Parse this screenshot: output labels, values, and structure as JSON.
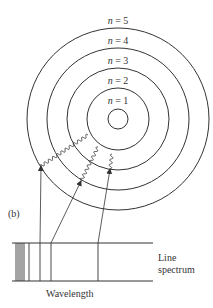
{
  "diagram": {
    "title_panel_label": "(b)",
    "orbit_labels": [
      {
        "label": "n = 5",
        "var": "n",
        "value": "5",
        "x": 118,
        "y": 15
      },
      {
        "label": "n = 4",
        "var": "n",
        "value": "4",
        "x": 118,
        "y": 35
      },
      {
        "label": "n = 3",
        "var": "n",
        "value": "3",
        "x": 118,
        "y": 55
      },
      {
        "label": "n = 2",
        "var": "n",
        "value": "2",
        "x": 118,
        "y": 75
      },
      {
        "label": "n = 1",
        "var": "n",
        "value": "1",
        "x": 118,
        "y": 95
      }
    ],
    "nucleus": {
      "cx": 118,
      "cy": 119,
      "r": 10
    },
    "orbits_radii": [
      31,
      51,
      71,
      91
    ],
    "transitions": [
      {
        "name": "transition-a",
        "wavy_from": [
          88,
          135
        ],
        "wavy_to": [
          41,
          166
        ],
        "line_to": [
          40,
          243
        ]
      },
      {
        "name": "transition-b",
        "wavy_from": [
          98,
          147
        ],
        "wavy_to": [
          81,
          181
        ],
        "line_to": [
          51,
          243
        ]
      },
      {
        "name": "transition-c",
        "wavy_from": [
          112,
          154
        ],
        "wavy_to": [
          110,
          169
        ],
        "line_to": [
          98,
          243
        ]
      }
    ],
    "spectrum": {
      "label_line1": "Line",
      "label_line2": "spectrum",
      "axis_label": "Wavelength",
      "box": {
        "x1": 12,
        "x2": 153,
        "y_top": 243,
        "y_bottom": 281
      },
      "lines_x": [
        16,
        18,
        20,
        22,
        24,
        29,
        40,
        51,
        98
      ]
    },
    "colors": {
      "stroke": "#333333",
      "background": "#ffffff"
    }
  }
}
